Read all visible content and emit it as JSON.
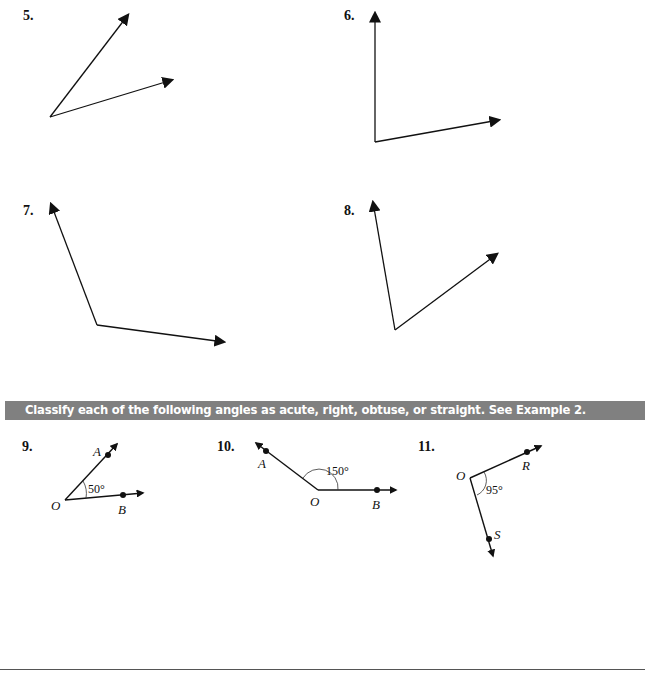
{
  "problems_top": [
    {
      "number": "5.",
      "description": "acute angle drawn with two rays"
    },
    {
      "number": "6.",
      "description": "right angle drawn with two rays"
    },
    {
      "number": "7.",
      "description": "obtuse angle drawn with two rays"
    },
    {
      "number": "8.",
      "description": "acute angle drawn with two rays"
    }
  ],
  "section": {
    "instruction": "Classify each of the following angles as acute, right, obtuse, or straight.  See Example 2.",
    "banner_color": "#808080"
  },
  "problems_bottom": [
    {
      "number": "9.",
      "vertex": "O",
      "point1": "A",
      "point2": "B",
      "measure": "50°"
    },
    {
      "number": "10.",
      "vertex": "O",
      "point1": "A",
      "point2": "B",
      "measure": "150°"
    },
    {
      "number": "11.",
      "vertex": "O",
      "point1": "R",
      "point2": "S",
      "measure": "95°"
    }
  ]
}
